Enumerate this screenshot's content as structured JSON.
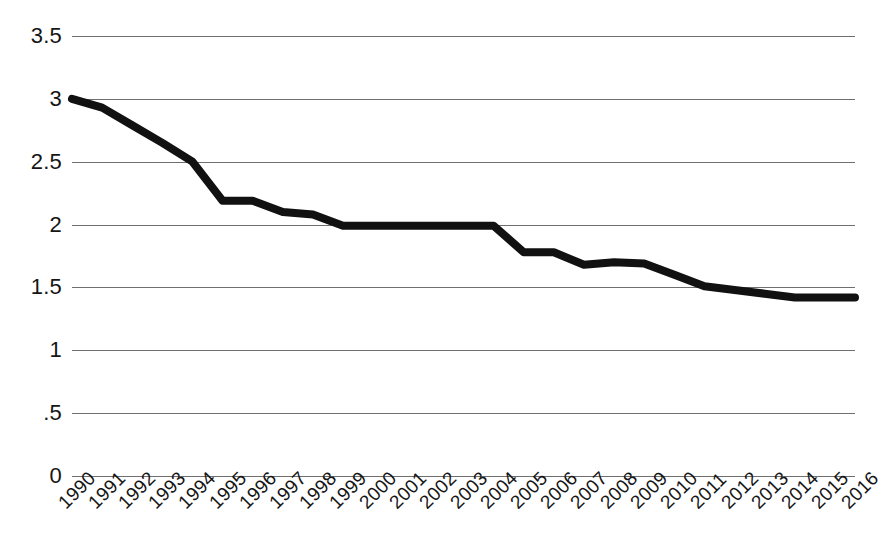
{
  "chart_data": {
    "type": "line",
    "title": "",
    "subtitle": "",
    "xlabel": "",
    "ylabel": "",
    "grid": true,
    "legend": "none",
    "xlim": [
      1990,
      2016
    ],
    "ylim": [
      0,
      3.5
    ],
    "categories": [
      "1990",
      "1991",
      "1992",
      "1993",
      "1994",
      "1995",
      "1996",
      "1997",
      "1998",
      "1999",
      "2000",
      "2001",
      "2002",
      "2003",
      "2004",
      "2005",
      "2006",
      "2007",
      "2008",
      "2009",
      "2010",
      "2011",
      "2012",
      "2013",
      "2014",
      "2015",
      "2016"
    ],
    "y_tick_labels": [
      "3.5",
      "3",
      "2.5",
      "2",
      "1.5",
      "1",
      ".5",
      "0"
    ],
    "y_tick_values": [
      3.5,
      3,
      2.5,
      2,
      1.5,
      1,
      0.5,
      0
    ],
    "series": [
      {
        "name": "series-1",
        "color": "#111111",
        "values": [
          3.0,
          2.93,
          2.79,
          2.65,
          2.5,
          2.19,
          2.19,
          2.1,
          2.08,
          1.99,
          1.99,
          1.99,
          1.99,
          1.99,
          1.99,
          1.78,
          1.78,
          1.68,
          1.7,
          1.69,
          1.6,
          1.51,
          1.48,
          1.45,
          1.42,
          1.42,
          1.42
        ]
      }
    ]
  }
}
